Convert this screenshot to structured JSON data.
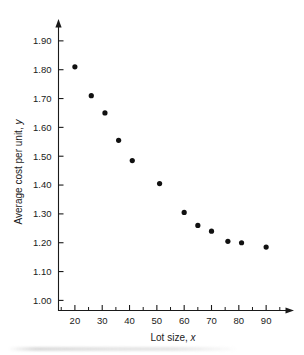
{
  "chart_data": {
    "type": "scatter",
    "title": "",
    "xlabel": "Lot size, x",
    "ylabel": "Average cost per unit, y",
    "xlabel_text": "Lot size,",
    "xlabel_var": "x",
    "ylabel_text": "Average cost per unit,",
    "ylabel_var": "y",
    "x": [
      20,
      26,
      31,
      36,
      41,
      51,
      60,
      65,
      70,
      76,
      81,
      90
    ],
    "y": [
      1.81,
      1.71,
      1.65,
      1.555,
      1.485,
      1.405,
      1.305,
      1.26,
      1.24,
      1.205,
      1.2,
      1.185
    ],
    "points": [
      {
        "x": 20,
        "y": 1.81
      },
      {
        "x": 26,
        "y": 1.71
      },
      {
        "x": 31,
        "y": 1.65
      },
      {
        "x": 36,
        "y": 1.555
      },
      {
        "x": 41,
        "y": 1.485
      },
      {
        "x": 51,
        "y": 1.405
      },
      {
        "x": 60,
        "y": 1.305
      },
      {
        "x": 65,
        "y": 1.26
      },
      {
        "x": 70,
        "y": 1.24
      },
      {
        "x": 76,
        "y": 1.205
      },
      {
        "x": 81,
        "y": 1.2
      },
      {
        "x": 90,
        "y": 1.185
      }
    ],
    "xlim": [
      14,
      98
    ],
    "ylim": [
      0.965,
      1.955
    ],
    "xticks": [
      20,
      30,
      40,
      50,
      60,
      70,
      80,
      90
    ],
    "xtick_labels": [
      "20",
      "30",
      "40",
      "50",
      "60",
      "70",
      "80",
      "90"
    ],
    "xticks_minor": [
      15,
      25,
      35,
      45,
      55,
      65,
      75,
      85,
      95
    ],
    "yticks": [
      1.0,
      1.1,
      1.2,
      1.3,
      1.4,
      1.5,
      1.6,
      1.7,
      1.8,
      1.9
    ],
    "ytick_labels": [
      "1.00",
      "1.10",
      "1.20",
      "1.30",
      "1.40",
      "1.50",
      "1.60",
      "1.70",
      "1.80",
      "1.90"
    ],
    "grid": false,
    "legend": null,
    "marker": "filled-circle",
    "marker_color": "#111111",
    "axis_color": "#1a1a1a",
    "background": "#ffffff"
  }
}
